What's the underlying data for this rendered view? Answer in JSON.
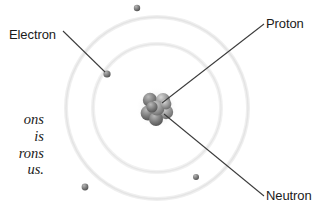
{
  "diagram": {
    "title_visible": false,
    "background_color": "#ffffff",
    "canvas": {
      "width": 315,
      "height": 214
    },
    "nucleus": {
      "name": "nucleus",
      "center": {
        "x": 157,
        "y": 108
      },
      "radius": 15,
      "particle_color": "#8a8a8a",
      "particle_color_dark": "#5e5e5e"
    },
    "orbits": [
      {
        "name": "inner-orbit",
        "radius": 64,
        "stroke": "#ededed"
      },
      {
        "name": "outer-orbit",
        "radius": 91,
        "stroke": "#f0f0f0"
      }
    ],
    "electrons": [
      {
        "name": "electron-upper-left",
        "x": 107,
        "y": 74,
        "r": 3.6
      },
      {
        "name": "electron-top",
        "x": 137,
        "y": 8,
        "r": 3.2
      },
      {
        "name": "electron-lower-left",
        "x": 85,
        "y": 187,
        "r": 3.4
      },
      {
        "name": "electron-lower-right",
        "x": 196,
        "y": 177,
        "r": 3.0
      }
    ],
    "leader_lines": [
      {
        "name": "leader-line-electron",
        "x1": 63,
        "y1": 31,
        "x2": 105,
        "y2": 72,
        "stroke": "#3b3b3b"
      },
      {
        "name": "leader-line-proton",
        "x1": 264,
        "y1": 24,
        "x2": 163,
        "y2": 103,
        "stroke": "#3b3b3b"
      },
      {
        "name": "leader-line-neutron",
        "x1": 264,
        "y1": 196,
        "x2": 164,
        "y2": 114,
        "stroke": "#3b3b3b"
      }
    ],
    "labels": {
      "electron": "Electron",
      "proton": "Proton",
      "neutron": "Neutron"
    },
    "caption_lines": [
      "ons",
      "is",
      "rons",
      "us."
    ],
    "colors": {
      "label_text": "#1b1b1b",
      "caption_text": "#191919",
      "leader_line": "#3b3b3b"
    }
  }
}
